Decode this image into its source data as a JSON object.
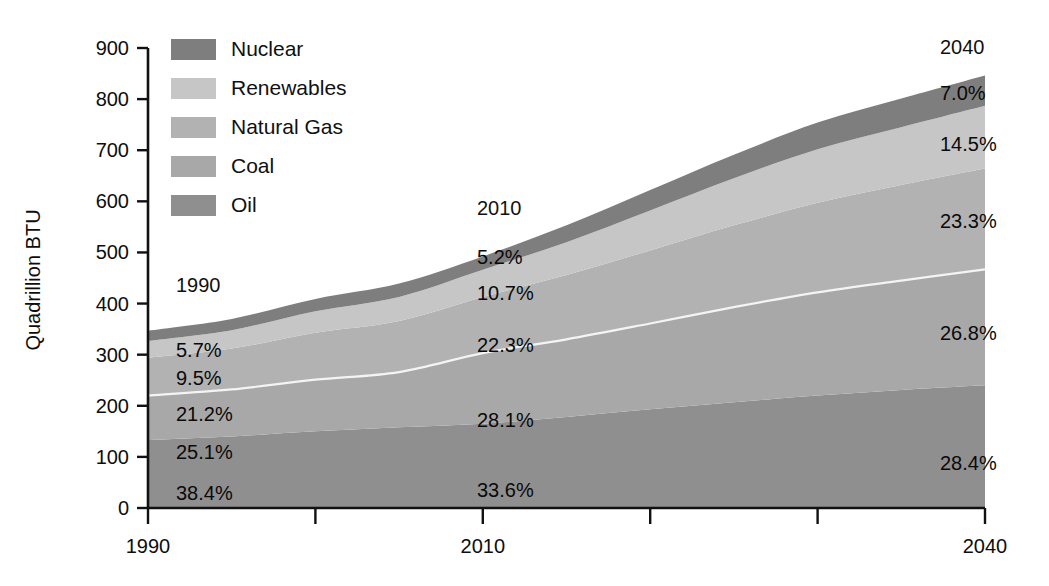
{
  "chart_data": {
    "type": "area",
    "title": "",
    "xlabel": "",
    "ylabel": "Quadrillion BTU",
    "xlim": [
      1990,
      2040
    ],
    "ylim": [
      0,
      900
    ],
    "grid": false,
    "stacked": true,
    "legend_position": "top-left",
    "x": [
      1990,
      1995,
      2000,
      2005,
      2010,
      2015,
      2020,
      2025,
      2030,
      2035,
      2040
    ],
    "series": [
      {
        "name": "Oil",
        "values": [
          133,
          140,
          150,
          158,
          165,
          178,
          193,
          207,
          220,
          231,
          240
        ]
      },
      {
        "name": "Coal",
        "values": [
          87,
          92,
          101,
          108,
          138,
          152,
          168,
          186,
          202,
          214,
          227
        ]
      },
      {
        "name": "Natural Gas",
        "values": [
          74,
          80,
          92,
          100,
          110,
          126,
          143,
          160,
          175,
          187,
          197
        ]
      },
      {
        "name": "Renewables",
        "values": [
          33,
          36,
          42,
          47,
          53,
          64,
          78,
          92,
          105,
          113,
          123
        ]
      },
      {
        "name": "Nuclear",
        "values": [
          20,
          22,
          24,
          26,
          26,
          33,
          40,
          46,
          52,
          56,
          59
        ]
      }
    ],
    "totals": [
      347,
      370,
      409,
      439,
      492,
      553,
      622,
      691,
      754,
      801,
      846
    ],
    "xticks": [
      1990,
      2000,
      2010,
      2020,
      2030,
      2040
    ],
    "xtick_labels_shown": [
      "1990",
      "2010",
      "2040"
    ],
    "yticks": [
      0,
      100,
      200,
      300,
      400,
      500,
      600,
      700,
      800,
      900
    ],
    "annotations": [
      {
        "year_label": "1990",
        "percents": {
          "nuclear": "5.7%",
          "renewables": "9.5%",
          "natural_gas": "21.2%",
          "coal": "25.1%",
          "oil": "38.4%"
        }
      },
      {
        "year_label": "2010",
        "percents": {
          "nuclear": "5.2%",
          "renewables": "10.7%",
          "natural_gas": "22.3%",
          "coal": "28.1%",
          "oil": "33.6%"
        }
      },
      {
        "year_label": "2040",
        "percents": {
          "nuclear": "7.0%",
          "renewables": "14.5%",
          "natural_gas": "23.3%",
          "coal": "26.8%",
          "oil": "28.4%"
        }
      }
    ]
  },
  "axes": {
    "y_title": "Quadrillion BTU",
    "y_ticks": [
      "900",
      "800",
      "700",
      "600",
      "500",
      "400",
      "300",
      "200",
      "100",
      "0"
    ],
    "x_ticks": [
      "1990",
      "2010",
      "2040"
    ]
  },
  "legend": {
    "items": [
      {
        "label": "Nuclear",
        "color": "#7e7e7e"
      },
      {
        "label": "Renewables",
        "color": "#c6c6c6"
      },
      {
        "label": "Natural Gas",
        "color": "#b2b2b2"
      },
      {
        "label": "Coal",
        "color": "#a8a8a8"
      },
      {
        "label": "Oil",
        "color": "#8f8f8f"
      }
    ]
  },
  "annotations_1990": {
    "year": "1990",
    "p_nuclear": "5.7%",
    "p_renewables": "9.5%",
    "p_natural_gas": "21.2%",
    "p_coal": "25.1%",
    "p_oil": "38.4%"
  },
  "annotations_2010": {
    "year": "2010",
    "p_nuclear": "5.2%",
    "p_renewables": "10.7%",
    "p_natural_gas": "22.3%",
    "p_coal": "28.1%",
    "p_oil": "33.6%"
  },
  "annotations_2040": {
    "year": "2040",
    "p_nuclear": "7.0%",
    "p_renewables": "14.5%",
    "p_natural_gas": "23.3%",
    "p_coal": "26.8%",
    "p_oil": "28.4%"
  },
  "colors": {
    "nuclear": "#7e7e7e",
    "renewables": "#c6c6c6",
    "natural_gas": "#b2b2b2",
    "coal": "#a8a8a8",
    "oil": "#8f8f8f",
    "axis": "#111111",
    "separator": "#f4f4f4",
    "background": "#ffffff"
  }
}
